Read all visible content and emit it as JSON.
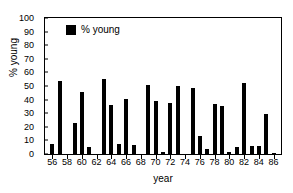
{
  "chart_data": {
    "type": "bar",
    "title": "",
    "xlabel": "year",
    "ylabel": "% young",
    "ylim": [
      0,
      100
    ],
    "xlim": [
      55,
      87
    ],
    "ytick_step": 10,
    "xtick_step": 2,
    "grid": false,
    "legend": {
      "position": "top-left",
      "entries": [
        {
          "name": "% young",
          "color": "#000000"
        }
      ]
    },
    "yticks": [
      0,
      10,
      20,
      30,
      40,
      50,
      60,
      70,
      80,
      90,
      100
    ],
    "xticks": [
      56,
      58,
      60,
      62,
      64,
      66,
      68,
      70,
      72,
      74,
      76,
      78,
      80,
      82,
      84,
      86
    ],
    "categories": [
      56,
      57,
      58,
      59,
      60,
      61,
      62,
      63,
      64,
      65,
      66,
      67,
      68,
      69,
      70,
      71,
      72,
      73,
      74,
      75,
      76,
      77,
      78,
      79,
      80,
      81,
      82,
      83,
      84,
      85,
      86
    ],
    "series": [
      {
        "name": "% young",
        "color": "#000000",
        "values": [
          7.5,
          53.5,
          0,
          22.5,
          45.5,
          5,
          0,
          55,
          36,
          7.5,
          40.5,
          6.5,
          0,
          51,
          39,
          1.5,
          37.5,
          50,
          0,
          48.5,
          13.5,
          4,
          36.5,
          35,
          1.5,
          5.5,
          52.5,
          6,
          6,
          29.5,
          1
        ]
      }
    ]
  }
}
